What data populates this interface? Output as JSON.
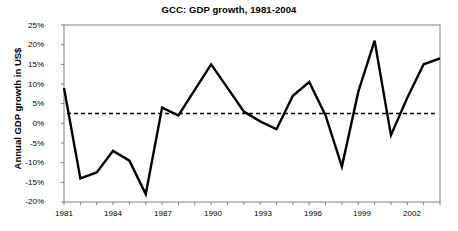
{
  "chart_data": {
    "type": "line",
    "title": "GCC: GDP growth, 1981-2004",
    "xlabel": "",
    "ylabel": "Annual GDP growth in US$",
    "xlim": [
      1981,
      2004
    ],
    "ylim": [
      -20,
      25
    ],
    "ytick_labels": [
      "25%",
      "20%",
      "15%",
      "10%",
      "5%",
      "0%",
      "-5%",
      "-10%",
      "-15%",
      "-20%"
    ],
    "ytick_values": [
      25,
      20,
      15,
      10,
      5,
      0,
      -5,
      -10,
      -15,
      -20
    ],
    "xtick_labels": [
      "1981",
      "1984",
      "1987",
      "1990",
      "1993",
      "1996",
      "1999",
      "2002"
    ],
    "xtick_values": [
      1981,
      1984,
      1987,
      1990,
      1993,
      1996,
      1999,
      2002
    ],
    "grid": false,
    "legend": "none",
    "x": [
      1981,
      1982,
      1983,
      1984,
      1985,
      1986,
      1987,
      1988,
      1989,
      1990,
      1991,
      1992,
      1993,
      1994,
      1995,
      1996,
      1997,
      1998,
      1999,
      2000,
      2001,
      2002,
      2003,
      2004
    ],
    "series": [
      {
        "name": "Annual GDP growth rate",
        "style": "solid",
        "color": "#000000",
        "values": [
          9.0,
          -14.0,
          -12.5,
          -7.0,
          -9.5,
          -18.0,
          4.0,
          2.0,
          8.5,
          15.0,
          9.0,
          3.0,
          0.5,
          -1.5,
          7.0,
          10.5,
          2.0,
          -11.0,
          8.0,
          21.0,
          -3.0,
          6.5,
          15.0,
          16.5
        ]
      },
      {
        "name": "Long-term average growth",
        "style": "dashed",
        "color": "#000000",
        "constant": 2.5
      }
    ],
    "annotations": [
      {
        "text": "Long-term average growth",
        "x": 1982.0,
        "y": 7.0
      },
      {
        "text": "Annual GDP growth rate",
        "x": 1987.0,
        "y": -7.5
      }
    ]
  },
  "axis": {
    "frame_color": "#808080",
    "tick_color": "#808080"
  }
}
